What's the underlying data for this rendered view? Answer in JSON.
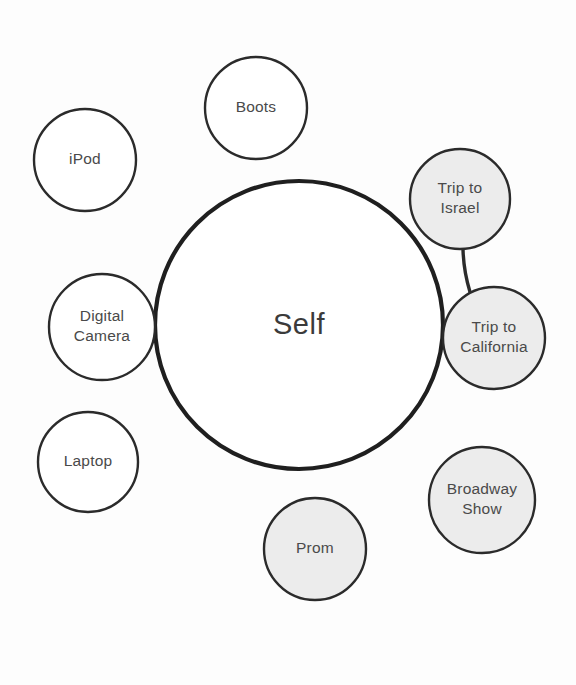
{
  "diagram": {
    "title_text": "Self",
    "center": {
      "label": "Self",
      "cx": 299,
      "cy": 325,
      "r": 144,
      "stroke": "#1f1f1f",
      "stroke_width": 4.2,
      "fill": "#ffffff"
    },
    "style": {
      "background": "#fdfdfd",
      "node_stroke": "#2b2b2b",
      "node_stroke_width": 2.4,
      "shaded_fill": "#ececec",
      "plain_fill": "#ffffff",
      "label_color": "#4a4a4a",
      "center_label_color": "#3b3b3b"
    },
    "nodes": [
      {
        "id": "ipod",
        "label": "iPod",
        "lines": [
          "iPod"
        ],
        "cx": 85,
        "cy": 160,
        "r": 51,
        "shaded": false,
        "attached": false
      },
      {
        "id": "boots",
        "label": "Boots",
        "lines": [
          "Boots"
        ],
        "cx": 256,
        "cy": 108,
        "r": 51,
        "shaded": false,
        "attached": true
      },
      {
        "id": "trip-to-israel",
        "label": "Trip to Israel",
        "lines": [
          "Trip to",
          "Israel"
        ],
        "cx": 460,
        "cy": 199,
        "r": 50,
        "shaded": true,
        "attached": true
      },
      {
        "id": "trip-to-california",
        "label": "Trip to California",
        "lines": [
          "Trip to",
          "California"
        ],
        "cx": 494,
        "cy": 338,
        "r": 51,
        "shaded": true,
        "attached": true
      },
      {
        "id": "broadway-show",
        "label": "Broadway Show",
        "lines": [
          "Broadway",
          "Show"
        ],
        "cx": 482,
        "cy": 500,
        "r": 53,
        "shaded": true,
        "attached": false
      },
      {
        "id": "prom",
        "label": "Prom",
        "lines": [
          "Prom"
        ],
        "cx": 315,
        "cy": 549,
        "r": 51,
        "shaded": true,
        "attached": true
      },
      {
        "id": "laptop",
        "label": "Laptop",
        "lines": [
          "Laptop"
        ],
        "cx": 88,
        "cy": 462,
        "r": 50,
        "shaded": false,
        "attached": false
      },
      {
        "id": "digital-camera",
        "label": "Digital Camera",
        "lines": [
          "Digital",
          "Camera"
        ],
        "cx": 102,
        "cy": 327,
        "r": 53,
        "shaded": false,
        "attached": true
      }
    ],
    "connectors": [
      {
        "id": "israel-to-california",
        "from": "trip-to-israel",
        "to": "trip-to-california",
        "x1": 463,
        "y1": 249,
        "x2": 470,
        "y2": 292
      }
    ]
  }
}
